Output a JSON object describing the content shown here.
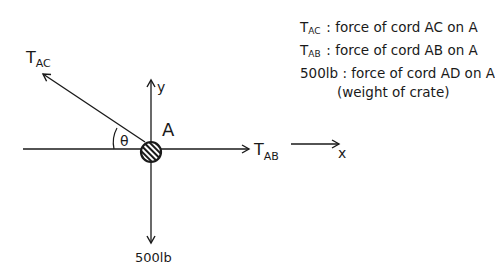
{
  "diagram": {
    "type": "free-body-diagram",
    "point_label": "A",
    "axes": {
      "x_label": "x",
      "y_label": "y"
    },
    "angle_label": "θ",
    "forces": [
      {
        "symbol": "T",
        "subscript": "AC",
        "direction": "up-left"
      },
      {
        "symbol": "T",
        "subscript": "AB",
        "direction": "right"
      },
      {
        "symbol": "500lb",
        "subscript": "",
        "direction": "down"
      }
    ],
    "colors": {
      "ink": "#1a1a1a",
      "background": "#ffffff"
    }
  },
  "legend": {
    "items": [
      {
        "symbol": "T",
        "subscript": "AC",
        "separator": ":",
        "text": "force of cord AC on A"
      },
      {
        "symbol": "T",
        "subscript": "AB",
        "separator": ":",
        "text": "force of cord AB on A"
      },
      {
        "symbol": "500lb",
        "subscript": "",
        "separator": ":",
        "text": "force of cord AD on A",
        "continuation": "(weight of crate)"
      }
    ]
  }
}
